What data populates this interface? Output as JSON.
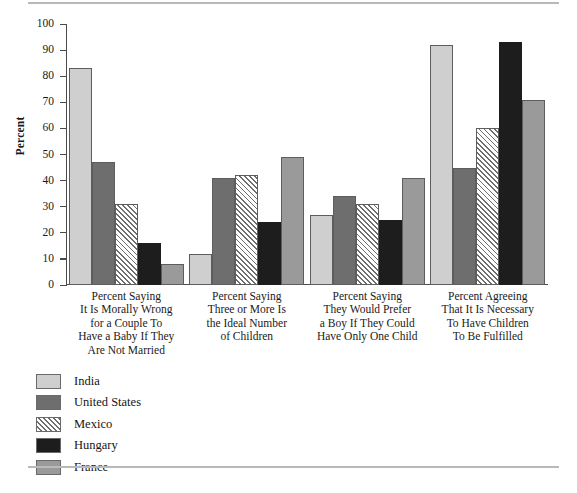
{
  "chart_data": {
    "type": "bar",
    "title": "",
    "subtitle": "",
    "xlabel": "",
    "ylabel": "Percent",
    "ylim": [
      0,
      100
    ],
    "ytick_labels": [
      "100",
      "90",
      "80",
      "70",
      "60",
      "50",
      "40",
      "30",
      "20",
      "10",
      "0"
    ],
    "ytick_values": [
      100,
      90,
      80,
      70,
      60,
      50,
      40,
      30,
      20,
      10,
      0
    ],
    "grid": false,
    "legend_position": "bottom-left",
    "categories": [
      "Percent Saying\nIt Is Morally Wrong\nfor a Couple To\nHave a Baby If They\nAre Not Married",
      "Percent Saying\nThree or More Is\nthe Ideal Number\nof Children",
      "Percent Saying\nThey Would Prefer\na Boy If They Could\nHave Only One Child",
      "Percent Agreeing\nThat It Is Necessary\nTo Have Children\nTo Be Fulfilled"
    ],
    "series": [
      {
        "name": "India",
        "color": "#cfcfcf",
        "pattern": "solid",
        "values": [
          83,
          12,
          27,
          92
        ]
      },
      {
        "name": "United States",
        "color": "#6e6e6e",
        "pattern": "solid",
        "values": [
          47,
          41,
          34,
          45
        ]
      },
      {
        "name": "Mexico",
        "color": "#ffffff",
        "pattern": "hatch",
        "values": [
          31,
          42,
          31,
          60
        ]
      },
      {
        "name": "Hungary",
        "color": "#1d1d1d",
        "pattern": "solid",
        "values": [
          16,
          24,
          25,
          93
        ]
      },
      {
        "name": "France",
        "color": "#9a9a9a",
        "pattern": "solid",
        "values": [
          8,
          49,
          41,
          71
        ]
      }
    ]
  },
  "legend": {
    "items": [
      {
        "label": "India"
      },
      {
        "label": "United States"
      },
      {
        "label": "Mexico"
      },
      {
        "label": "Hungary"
      },
      {
        "label": "France"
      }
    ]
  }
}
